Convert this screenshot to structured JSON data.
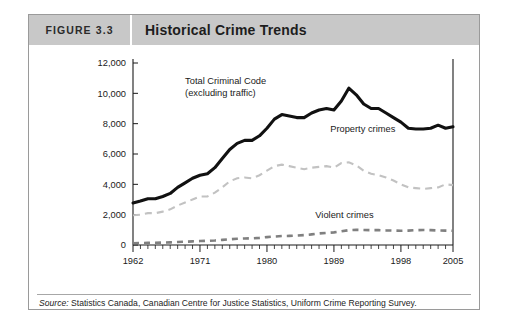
{
  "figure": {
    "number": "FIGURE 3.3",
    "title": "Historical Crime Trends",
    "source_label": "Source:",
    "source_text": " Statistics Canada, Canadian Centre for Justice Statistics, Uniform Crime Reporting Survey."
  },
  "colors": {
    "header_background": "#c8c8c8",
    "frame_border": "#9a9a9a",
    "total_line": "#111111",
    "property_line": "#c2c2c2",
    "violent_line": "#808080",
    "axis": "#1a1a1a",
    "page_background": "#ffffff"
  },
  "chart_data": {
    "type": "line",
    "title": "Historical Crime Trends",
    "xlabel": "",
    "ylabel": "",
    "xlim": [
      1962,
      2005
    ],
    "ylim": [
      0,
      12000
    ],
    "grid": false,
    "legend": "annotations-inline",
    "ytick_labels": [
      "0",
      "2,000",
      "4,000",
      "6,000",
      "8,000",
      "10,000",
      "12,000"
    ],
    "ytick_values": [
      0,
      2000,
      4000,
      6000,
      8000,
      10000,
      12000
    ],
    "xtick_labels": [
      "1962",
      "1971",
      "1980",
      "1989",
      "1998",
      "2005"
    ],
    "xtick_values": [
      1962,
      1971,
      1980,
      1989,
      1998,
      2005
    ],
    "x": [
      1962,
      1963,
      1964,
      1965,
      1966,
      1967,
      1968,
      1969,
      1970,
      1971,
      1972,
      1973,
      1974,
      1975,
      1976,
      1977,
      1978,
      1979,
      1980,
      1981,
      1982,
      1983,
      1984,
      1985,
      1986,
      1987,
      1988,
      1989,
      1990,
      1991,
      1992,
      1993,
      1994,
      1995,
      1996,
      1997,
      1998,
      1999,
      2000,
      2001,
      2002,
      2003,
      2004,
      2005
    ],
    "series": [
      {
        "name": "Total Criminal Code (excluding traffic)",
        "style": "solid",
        "annotation": "Total Criminal Code\n(excluding traffic)",
        "values": [
          2771,
          2900,
          3050,
          3050,
          3200,
          3400,
          3800,
          4100,
          4400,
          4600,
          4700,
          5100,
          5700,
          6300,
          6700,
          6900,
          6900,
          7200,
          7700,
          8300,
          8600,
          8500,
          8400,
          8400,
          8700,
          8900,
          9000,
          8900,
          9500,
          10340,
          9900,
          9300,
          9000,
          9000,
          8700,
          8400,
          8100,
          7700,
          7650,
          7650,
          7700,
          7900,
          7700,
          7800
        ]
      },
      {
        "name": "Property crimes",
        "style": "dashed",
        "annotation": "Property crimes",
        "values": [
          1960,
          2000,
          2100,
          2100,
          2200,
          2350,
          2600,
          2800,
          3000,
          3200,
          3200,
          3450,
          3800,
          4200,
          4400,
          4450,
          4400,
          4600,
          4900,
          5200,
          5300,
          5200,
          5100,
          5000,
          5100,
          5150,
          5200,
          5100,
          5400,
          5450,
          5250,
          4900,
          4700,
          4600,
          4450,
          4250,
          4000,
          3800,
          3750,
          3700,
          3750,
          3800,
          4000,
          3950
        ]
      },
      {
        "name": "Violent crimes",
        "style": "dashed",
        "annotation": "Violent crimes",
        "values": [
          120,
          130,
          140,
          150,
          160,
          175,
          195,
          215,
          240,
          260,
          275,
          300,
          340,
          380,
          410,
          430,
          440,
          470,
          520,
          560,
          590,
          600,
          620,
          650,
          700,
          760,
          800,
          830,
          900,
          980,
          1000,
          990,
          980,
          980,
          960,
          950,
          940,
          950,
          980,
          990,
          980,
          960,
          950,
          940
        ]
      }
    ]
  }
}
